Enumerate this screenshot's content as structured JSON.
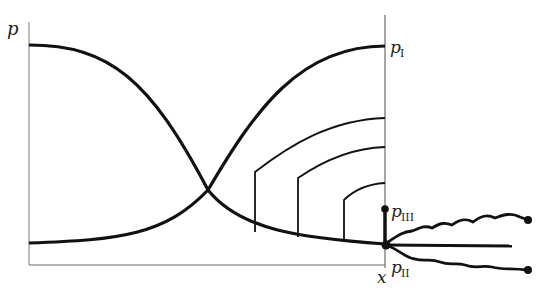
{
  "diagram": {
    "type": "pressure-profile",
    "axes": {
      "y_label": "p",
      "x_label": "x"
    },
    "labels": {
      "p1": {
        "main": "p",
        "sub": "I"
      },
      "p2": {
        "main": "p",
        "sub": "II"
      },
      "p3": {
        "main": "p",
        "sub": "III"
      }
    },
    "curves": [
      "falling sigmoid from high pressure (left) to low",
      "rising sigmoid to p_I at right axis",
      "three nested arcs rising to right axis",
      "thick vertical segment from p_II up to p_III",
      "three branching lines to the right of junction (two wavy with end dots, one straight)"
    ],
    "colors": {
      "curve": "#111111",
      "axis": "#888888"
    }
  }
}
